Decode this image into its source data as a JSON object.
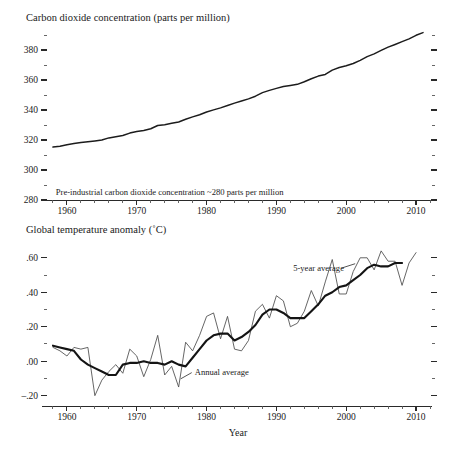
{
  "chart_data": [
    {
      "type": "line",
      "title": "Carbon dioxide concentration (parts per million)",
      "xlabel": "",
      "ylabel": "Carbon dioxide concentration (parts per million)",
      "xlim": [
        1957,
        2012
      ],
      "ylim": [
        280,
        392
      ],
      "grid": false,
      "legend": "none",
      "ytick_labels": [
        "380",
        "360",
        "340",
        "320",
        "300",
        "280"
      ],
      "ytick_values": [
        380,
        360,
        340,
        320,
        300,
        280
      ],
      "yminor_values": [
        390,
        370,
        350,
        330,
        310,
        290
      ],
      "xtick_labels": [
        "1960",
        "1970",
        "1980",
        "1990",
        "2000",
        "2010"
      ],
      "xtick_values": [
        1960,
        1970,
        1980,
        1990,
        2000,
        2010
      ],
      "annotations": [
        {
          "name": "pre-industrial-note",
          "text": "Pre-industrial carbon dioxide concentration ~280 parts per million",
          "x": 1958.4,
          "y": 283.5
        }
      ],
      "series": [
        {
          "name": "Mauna Loa CO2 annual mean",
          "x": [
            1958,
            1959,
            1960,
            1961,
            1962,
            1963,
            1964,
            1965,
            1966,
            1967,
            1968,
            1969,
            1970,
            1971,
            1972,
            1973,
            1974,
            1975,
            1976,
            1977,
            1978,
            1979,
            1980,
            1981,
            1982,
            1983,
            1984,
            1985,
            1986,
            1987,
            1988,
            1989,
            1990,
            1991,
            1992,
            1993,
            1994,
            1995,
            1996,
            1997,
            1998,
            1999,
            2000,
            2001,
            2002,
            2003,
            2004,
            2005,
            2006,
            2007,
            2008,
            2009,
            2010,
            2011
          ],
          "values": [
            315.3,
            315.9,
            316.9,
            317.6,
            318.4,
            318.9,
            319.4,
            320.0,
            321.4,
            322.2,
            323.0,
            324.6,
            325.7,
            326.3,
            327.5,
            329.7,
            330.2,
            331.1,
            332.0,
            333.8,
            335.4,
            336.8,
            338.7,
            340.1,
            341.4,
            343.0,
            344.6,
            346.0,
            347.4,
            349.2,
            351.6,
            353.1,
            354.4,
            355.6,
            356.4,
            357.1,
            358.8,
            360.8,
            362.6,
            363.7,
            366.6,
            368.3,
            369.5,
            371.0,
            373.1,
            375.6,
            377.4,
            379.7,
            381.9,
            383.7,
            385.6,
            387.4,
            389.8,
            391.6
          ]
        }
      ]
    },
    {
      "type": "line",
      "title": "Global temperature anomaly (˚C)",
      "xlabel": "Year",
      "ylabel": "Global temperature anomaly (˚C)",
      "xlim": [
        1957,
        2012
      ],
      "ylim": [
        -0.26,
        0.68
      ],
      "grid": false,
      "legend": "inline-annotations",
      "ytick_labels": [
        ".60",
        ".40",
        ".20",
        ".00",
        "–.20"
      ],
      "ytick_values": [
        0.6,
        0.4,
        0.2,
        0.0,
        -0.2
      ],
      "yminor_values": [
        0.5,
        0.3,
        0.1,
        -0.1
      ],
      "xtick_labels": [
        "1960",
        "1970",
        "1980",
        "1990",
        "2000",
        "2010"
      ],
      "xtick_values": [
        1960,
        1970,
        1980,
        1990,
        2000,
        2010
      ],
      "annotations": [
        {
          "name": "annual-average-label",
          "text": "Annual average",
          "x": 1978.3,
          "y": -0.085
        },
        {
          "name": "five-year-average-label",
          "text": "5-year average",
          "x": 1992.4,
          "y": 0.525
        }
      ],
      "series": [
        {
          "name": "Annual average",
          "x": [
            1958,
            1959,
            1960,
            1961,
            1962,
            1963,
            1964,
            1965,
            1966,
            1967,
            1968,
            1969,
            1970,
            1971,
            1972,
            1973,
            1974,
            1975,
            1976,
            1977,
            1978,
            1979,
            1980,
            1981,
            1982,
            1983,
            1984,
            1985,
            1986,
            1987,
            1988,
            1989,
            1990,
            1991,
            1992,
            1993,
            1994,
            1995,
            1996,
            1997,
            1998,
            1999,
            2000,
            2001,
            2002,
            2003,
            2004,
            2005,
            2006,
            2007,
            2008,
            2009,
            2010
          ],
          "values": [
            0.08,
            0.06,
            0.03,
            0.08,
            0.07,
            0.08,
            -0.2,
            -0.11,
            -0.06,
            -0.02,
            -0.07,
            0.07,
            0.03,
            -0.09,
            0.01,
            0.15,
            -0.08,
            -0.03,
            -0.15,
            0.11,
            0.06,
            0.15,
            0.26,
            0.28,
            0.13,
            0.26,
            0.07,
            0.06,
            0.12,
            0.29,
            0.33,
            0.25,
            0.38,
            0.35,
            0.2,
            0.22,
            0.29,
            0.41,
            0.32,
            0.46,
            0.59,
            0.39,
            0.39,
            0.52,
            0.6,
            0.6,
            0.53,
            0.64,
            0.58,
            0.58,
            0.44,
            0.57,
            0.63
          ]
        },
        {
          "name": "5-year average",
          "x": [
            1958,
            1959,
            1960,
            1961,
            1962,
            1963,
            1964,
            1965,
            1966,
            1967,
            1968,
            1969,
            1970,
            1971,
            1972,
            1973,
            1974,
            1975,
            1976,
            1977,
            1978,
            1979,
            1980,
            1981,
            1982,
            1983,
            1984,
            1985,
            1986,
            1987,
            1988,
            1989,
            1990,
            1991,
            1992,
            1993,
            1994,
            1995,
            1996,
            1997,
            1998,
            1999,
            2000,
            2001,
            2002,
            2003,
            2004,
            2005,
            2006,
            2007,
            2008
          ],
          "values": [
            0.09,
            0.08,
            0.07,
            0.06,
            0.01,
            -0.02,
            -0.04,
            -0.06,
            -0.08,
            -0.08,
            -0.02,
            -0.01,
            -0.01,
            0.0,
            -0.01,
            -0.01,
            -0.02,
            0.0,
            -0.02,
            -0.03,
            0.02,
            0.07,
            0.12,
            0.15,
            0.16,
            0.16,
            0.12,
            0.14,
            0.17,
            0.21,
            0.27,
            0.3,
            0.3,
            0.28,
            0.25,
            0.25,
            0.25,
            0.29,
            0.33,
            0.38,
            0.4,
            0.43,
            0.44,
            0.47,
            0.5,
            0.54,
            0.56,
            0.55,
            0.55,
            0.57,
            0.57
          ]
        }
      ]
    }
  ],
  "colors": {
    "background": "#ffffff",
    "axis": "#2a2a2a",
    "co2_line": "#1c1c1c",
    "annual_line": "#4a4a4a",
    "smooth_line": "#141414",
    "text": "#1a1a1a"
  }
}
